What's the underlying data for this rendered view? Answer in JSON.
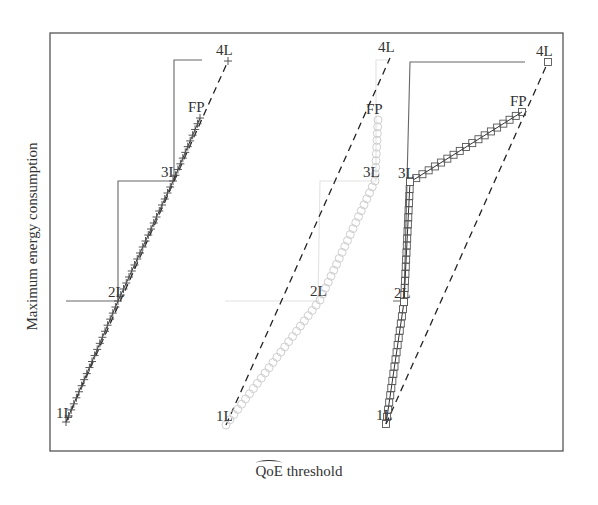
{
  "chart_data": {
    "type": "line",
    "title": "",
    "xlabel": "QoE threshold",
    "xlabel_hat_part": "QoE",
    "xlabel_rest": " threshold",
    "ylabel": "Maximum energy consumption",
    "grid": false,
    "legend": null,
    "axis_ticks": "none",
    "panels": [
      {
        "name": "panel-1",
        "marker": "plus",
        "marker_color": "#555555",
        "labels": [
          "1L",
          "2L",
          "3L",
          "FP",
          "4L"
        ],
        "points": {
          "1L": [
            66,
            422
          ],
          "2L": [
            118,
            301
          ],
          "3L": [
            173,
            181
          ],
          "FP": [
            200,
            118
          ],
          "4L": [
            228,
            61
          ]
        },
        "step_path": [
          [
            66,
            301
          ],
          [
            118,
            301
          ],
          [
            118,
            181
          ],
          [
            174,
            181
          ],
          [
            174,
            60
          ],
          [
            202,
            60
          ]
        ],
        "step_color": "#666666"
      },
      {
        "name": "panel-2",
        "marker": "circle",
        "marker_color": "#cfcfcf",
        "labels": [
          "1L",
          "2L",
          "3L",
          "FP",
          "4L"
        ],
        "points": {
          "1L": [
            226,
            425
          ],
          "2L": [
            320,
            300
          ],
          "3L": [
            375,
            181
          ],
          "FP": [
            378,
            120
          ],
          "4L": [
            390,
            58
          ]
        },
        "step_path": [
          [
            225,
            301
          ],
          [
            318,
            301
          ],
          [
            320,
            181
          ],
          [
            376,
            181
          ],
          [
            376,
            60
          ],
          [
            390,
            60
          ]
        ],
        "step_color": "#e2e2e2"
      },
      {
        "name": "panel-3",
        "marker": "square",
        "marker_color": "#555555",
        "labels": [
          "1L",
          "2L",
          "3L",
          "FP",
          "4L"
        ],
        "points": {
          "1L": [
            386,
            424
          ],
          "2L": [
            404,
            302
          ],
          "3L": [
            410,
            182
          ],
          "FP": [
            522,
            112
          ],
          "4L": [
            548,
            62
          ]
        },
        "step_path": [
          [
            393,
            301
          ],
          [
            404,
            301
          ],
          [
            410,
            62
          ],
          [
            525,
            62
          ]
        ],
        "step_color": "#666666"
      }
    ]
  }
}
